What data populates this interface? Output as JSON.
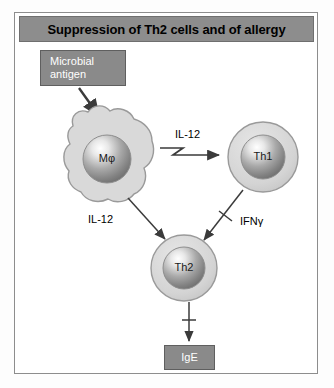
{
  "figure": {
    "title": "Suppression of Th2 cells and of allergy"
  },
  "nodes": {
    "antigen": {
      "line1": "Microbial",
      "line2": "antigen"
    },
    "macrophage": {
      "label": "Mφ"
    },
    "th1": {
      "label": "Th1"
    },
    "th2": {
      "label": "Th2"
    },
    "ige": {
      "label": "IgE"
    }
  },
  "edges": {
    "il12_to_th1": "IL-12",
    "il12_to_th2": "IL-12",
    "ifng_to_th2": "IFNγ"
  },
  "colors": {
    "title_bar": "#8d8d8d",
    "box_fill": "#8a8a8a",
    "cell_fill": "#d6d6d6",
    "macrophage_fill": "#d9d9d9",
    "stroke": "#6f6f6f",
    "text_dark": "#000000",
    "text_light": "#ffffff"
  }
}
